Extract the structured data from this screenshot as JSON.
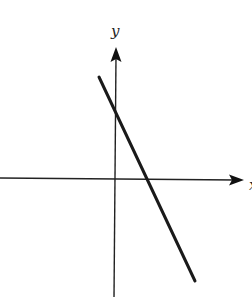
{
  "diagram": {
    "type": "coordinate-plane-line",
    "axes": {
      "x_label": "x",
      "y_label": "y",
      "origin_px": [
        114,
        178
      ],
      "x_axis": {
        "start": [
          0,
          178
        ],
        "end": [
          244,
          180
        ]
      },
      "y_axis": {
        "start": [
          114,
          297
        ],
        "end": [
          116,
          47
        ]
      }
    },
    "line": {
      "start": [
        99,
        77
      ],
      "end": [
        195,
        281
      ],
      "y_intercept_px": [
        114,
        110
      ],
      "x_intercept_px": [
        147,
        179
      ],
      "slope_sign": "negative",
      "color": "#1a1a1a"
    },
    "colors": {
      "axis": "#222222",
      "line": "#1a1a1a",
      "background": "#ffffff"
    }
  }
}
